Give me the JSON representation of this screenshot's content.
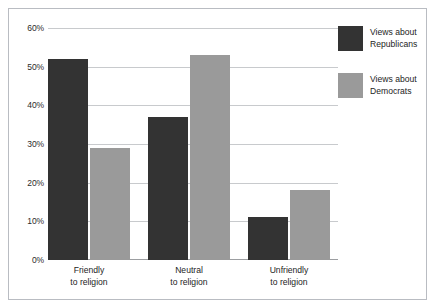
{
  "chart_data": {
    "type": "bar",
    "title": "",
    "subtitle": "",
    "xlabel": "",
    "ylabel": "",
    "categories": [
      "Friendly to religion",
      "Neutral to religion",
      "Unfriendly to religion"
    ],
    "category_lines": [
      [
        "Friendly",
        "to religion"
      ],
      [
        "Neutral",
        "to religion"
      ],
      [
        "Unfriendly",
        "to religion"
      ]
    ],
    "series": [
      {
        "name": "Views about Republicans",
        "values": [
          52,
          37,
          11
        ],
        "color": "#333333"
      },
      {
        "name": "Views about Democrats",
        "values": [
          29,
          53,
          18
        ],
        "color": "#9a9a9a"
      }
    ],
    "ylim": [
      0,
      60
    ],
    "ytick_values": [
      0,
      10,
      20,
      30,
      40,
      50,
      60
    ],
    "ytick_labels": [
      "0%",
      "10%",
      "20%",
      "30%",
      "40%",
      "50%",
      "60%"
    ],
    "grid": true,
    "legend_position": "right"
  },
  "legend": {
    "entries": [
      {
        "line1": "Views about",
        "line2": "Republicans",
        "color": "#333333"
      },
      {
        "line1": "Views about",
        "line2": "Democrats",
        "color": "#9a9a9a"
      }
    ]
  },
  "colors": {
    "series_republicans": "#333333",
    "series_democrats": "#9a9a9a",
    "gridline": "#c8cacd",
    "frame": "#b9bcc2",
    "background": "#ffffff",
    "text": "#1d1d1d"
  }
}
